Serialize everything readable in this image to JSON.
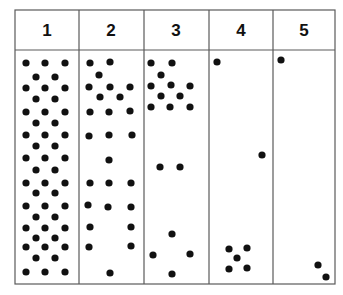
{
  "table": {
    "box": {
      "left": 15,
      "top": 10,
      "right": 335,
      "bottom": 284,
      "header_bottom": 50
    },
    "column_dividers": [
      79,
      144,
      209,
      273
    ],
    "line_color": "#5a5a5a",
    "dot_color": "#111111",
    "dot_radius": 3.6,
    "columns": [
      {
        "label": "1",
        "center_x": 47,
        "dots": [
          [
            26,
            63
          ],
          [
            45,
            63
          ],
          [
            65,
            63
          ],
          [
            36,
            77
          ],
          [
            55,
            77
          ],
          [
            26,
            88
          ],
          [
            45,
            88
          ],
          [
            65,
            88
          ],
          [
            36,
            99
          ],
          [
            55,
            99
          ],
          [
            26,
            112
          ],
          [
            45,
            112
          ],
          [
            65,
            112
          ],
          [
            36,
            123
          ],
          [
            55,
            123
          ],
          [
            26,
            135
          ],
          [
            45,
            135
          ],
          [
            65,
            135
          ],
          [
            36,
            146
          ],
          [
            55,
            146
          ],
          [
            26,
            158
          ],
          [
            45,
            158
          ],
          [
            65,
            158
          ],
          [
            36,
            170
          ],
          [
            55,
            170
          ],
          [
            26,
            183
          ],
          [
            45,
            183
          ],
          [
            65,
            183
          ],
          [
            36,
            193
          ],
          [
            55,
            193
          ],
          [
            26,
            206
          ],
          [
            45,
            206
          ],
          [
            65,
            206
          ],
          [
            36,
            217
          ],
          [
            55,
            217
          ],
          [
            26,
            228
          ],
          [
            45,
            228
          ],
          [
            65,
            228
          ],
          [
            36,
            238
          ],
          [
            55,
            238
          ],
          [
            26,
            247
          ],
          [
            45,
            247
          ],
          [
            65,
            247
          ],
          [
            36,
            258
          ],
          [
            55,
            258
          ],
          [
            26,
            272
          ],
          [
            45,
            272
          ],
          [
            65,
            272
          ]
        ]
      },
      {
        "label": "2",
        "center_x": 111,
        "dots": [
          [
            90,
            63
          ],
          [
            110,
            62
          ],
          [
            99,
            75
          ],
          [
            89,
            87
          ],
          [
            110,
            87
          ],
          [
            130,
            87
          ],
          [
            100,
            97
          ],
          [
            120,
            97
          ],
          [
            90,
            112
          ],
          [
            109,
            112
          ],
          [
            130,
            111
          ],
          [
            89,
            136
          ],
          [
            109,
            135
          ],
          [
            132,
            135
          ],
          [
            109,
            160
          ],
          [
            90,
            183
          ],
          [
            109,
            183
          ],
          [
            131,
            183
          ],
          [
            88,
            205
          ],
          [
            108,
            207
          ],
          [
            131,
            207
          ],
          [
            90,
            227
          ],
          [
            131,
            227
          ],
          [
            89,
            247
          ],
          [
            131,
            246
          ],
          [
            110,
            273
          ]
        ]
      },
      {
        "label": "3",
        "center_x": 176,
        "dots": [
          [
            151,
            63
          ],
          [
            172,
            63
          ],
          [
            161,
            75
          ],
          [
            151,
            86
          ],
          [
            171,
            85
          ],
          [
            190,
            86
          ],
          [
            161,
            96
          ],
          [
            180,
            96
          ],
          [
            151,
            107
          ],
          [
            170,
            107
          ],
          [
            190,
            107
          ],
          [
            160,
            167
          ],
          [
            180,
            167
          ],
          [
            172,
            234
          ],
          [
            153,
            255
          ],
          [
            190,
            254
          ],
          [
            172,
            274
          ]
        ]
      },
      {
        "label": "4",
        "center_x": 241,
        "dots": [
          [
            217,
            62
          ],
          [
            262,
            155
          ],
          [
            229,
            249
          ],
          [
            247,
            248
          ],
          [
            237,
            258
          ],
          [
            229,
            269
          ],
          [
            247,
            268
          ]
        ]
      },
      {
        "label": "5",
        "center_x": 304,
        "dots": [
          [
            281,
            60
          ],
          [
            318,
            265
          ],
          [
            326,
            277
          ]
        ]
      }
    ]
  }
}
